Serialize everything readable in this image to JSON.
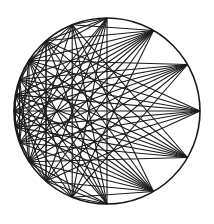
{
  "figure": {
    "title": "",
    "stroke_color": "#1a1a1a",
    "background": "#ffffff",
    "circle": {
      "cx": 107,
      "cy": 111,
      "r": 93
    },
    "inner_ellipse": {
      "cx": 60,
      "cy": 112,
      "rx": 12,
      "ry": 11
    },
    "right_point_angles_deg": [
      -90,
      -60,
      -30,
      0,
      30,
      60,
      90
    ],
    "left_point_angles_deg": [
      -112,
      -131,
      -147,
      -160,
      -170,
      -180,
      170,
      160,
      147,
      131,
      112
    ],
    "vertical_chords": [
      [
        -112,
        112
      ],
      [
        -131,
        131
      ],
      [
        -147,
        147
      ],
      [
        -160,
        160
      ]
    ]
  }
}
